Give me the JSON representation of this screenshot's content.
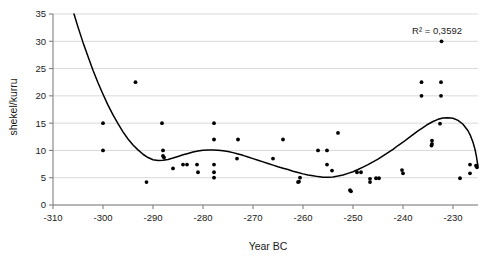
{
  "chart_data": {
    "type": "scatter",
    "title": "",
    "xlabel": "Year BC",
    "ylabel": "shekel/kurru",
    "xlim": [
      -310,
      -225
    ],
    "ylim": [
      0,
      35
    ],
    "xticks": [
      -310,
      -300,
      -290,
      -280,
      -270,
      -260,
      -250,
      -240,
      -230
    ],
    "xtick_labels": [
      "-310",
      "-300",
      "-290",
      "-280",
      "-270",
      "-260",
      "-250",
      "-240",
      "-230"
    ],
    "yticks": [
      0,
      5,
      10,
      15,
      20,
      25,
      30,
      35
    ],
    "ytick_labels": [
      "0",
      "5",
      "10",
      "15",
      "20",
      "25",
      "30",
      "35"
    ],
    "grid": "horizontal",
    "legend": "none",
    "annotations": [
      {
        "name": "r-squared",
        "text": "R² = 0,3592",
        "x": -232,
        "y": 32.5
      }
    ],
    "points": [
      {
        "x": -300.0,
        "y": 15.0
      },
      {
        "x": -300.0,
        "y": 10.0
      },
      {
        "x": -293.5,
        "y": 22.5
      },
      {
        "x": -291.3,
        "y": 4.2
      },
      {
        "x": -288.2,
        "y": 15.0
      },
      {
        "x": -288.0,
        "y": 10.0
      },
      {
        "x": -288.0,
        "y": 9.0
      },
      {
        "x": -287.8,
        "y": 8.7
      },
      {
        "x": -286.0,
        "y": 6.7
      },
      {
        "x": -284.0,
        "y": 7.4
      },
      {
        "x": -283.2,
        "y": 7.4
      },
      {
        "x": -281.2,
        "y": 7.4
      },
      {
        "x": -281.0,
        "y": 6.0
      },
      {
        "x": -277.8,
        "y": 15.0
      },
      {
        "x": -277.8,
        "y": 12.0
      },
      {
        "x": -277.8,
        "y": 7.4
      },
      {
        "x": -277.8,
        "y": 6.0
      },
      {
        "x": -277.8,
        "y": 5.0
      },
      {
        "x": -273.0,
        "y": 12.0
      },
      {
        "x": -273.2,
        "y": 8.5
      },
      {
        "x": -266.0,
        "y": 8.5
      },
      {
        "x": -264.0,
        "y": 12.0
      },
      {
        "x": -260.6,
        "y": 5.0
      },
      {
        "x": -260.8,
        "y": 4.3
      },
      {
        "x": -261.0,
        "y": 4.2
      },
      {
        "x": -257.0,
        "y": 10.0
      },
      {
        "x": -255.2,
        "y": 10.0
      },
      {
        "x": -255.2,
        "y": 7.4
      },
      {
        "x": -254.2,
        "y": 6.3
      },
      {
        "x": -253.0,
        "y": 13.2
      },
      {
        "x": -250.6,
        "y": 2.7
      },
      {
        "x": -250.4,
        "y": 2.5
      },
      {
        "x": -249.2,
        "y": 6.0
      },
      {
        "x": -248.4,
        "y": 6.0
      },
      {
        "x": -246.6,
        "y": 4.8
      },
      {
        "x": -246.6,
        "y": 4.2
      },
      {
        "x": -245.4,
        "y": 4.9
      },
      {
        "x": -244.8,
        "y": 4.9
      },
      {
        "x": -240.2,
        "y": 6.4
      },
      {
        "x": -240.0,
        "y": 5.8
      },
      {
        "x": -236.3,
        "y": 22.5
      },
      {
        "x": -236.3,
        "y": 20.0
      },
      {
        "x": -234.2,
        "y": 11.8
      },
      {
        "x": -234.2,
        "y": 11.2
      },
      {
        "x": -234.3,
        "y": 10.9
      },
      {
        "x": -232.3,
        "y": 30.0
      },
      {
        "x": -232.4,
        "y": 22.5
      },
      {
        "x": -232.4,
        "y": 20.0
      },
      {
        "x": -232.6,
        "y": 14.9
      },
      {
        "x": -228.6,
        "y": 4.9
      },
      {
        "x": -226.6,
        "y": 7.4
      },
      {
        "x": -226.6,
        "y": 5.8
      },
      {
        "x": -225.4,
        "y": 7.2
      },
      {
        "x": -225.2,
        "y": 6.9
      }
    ],
    "trendline": {
      "name": "polynomial-trendline",
      "r_squared": 0.3592,
      "r_squared_display": "0,3592",
      "points": [
        {
          "x": -305.8,
          "y": 35.0
        },
        {
          "x": -305.0,
          "y": 32.6
        },
        {
          "x": -304.0,
          "y": 29.8
        },
        {
          "x": -303.0,
          "y": 27.2
        },
        {
          "x": -302.0,
          "y": 24.7
        },
        {
          "x": -301.0,
          "y": 22.4
        },
        {
          "x": -300.0,
          "y": 20.3
        },
        {
          "x": -299.0,
          "y": 18.3
        },
        {
          "x": -298.0,
          "y": 16.5
        },
        {
          "x": -297.0,
          "y": 14.9
        },
        {
          "x": -296.0,
          "y": 13.4
        },
        {
          "x": -295.0,
          "y": 12.1
        },
        {
          "x": -294.0,
          "y": 11.0
        },
        {
          "x": -293.0,
          "y": 10.1
        },
        {
          "x": -292.0,
          "y": 9.3
        },
        {
          "x": -291.0,
          "y": 8.7
        },
        {
          "x": -290.0,
          "y": 8.3
        },
        {
          "x": -289.0,
          "y": 8.15
        },
        {
          "x": -288.0,
          "y": 8.2
        },
        {
          "x": -287.0,
          "y": 8.35
        },
        {
          "x": -286.0,
          "y": 8.6
        },
        {
          "x": -285.0,
          "y": 8.9
        },
        {
          "x": -284.0,
          "y": 9.2
        },
        {
          "x": -283.0,
          "y": 9.45
        },
        {
          "x": -282.0,
          "y": 9.7
        },
        {
          "x": -281.0,
          "y": 9.9
        },
        {
          "x": -280.0,
          "y": 10.05
        },
        {
          "x": -279.0,
          "y": 10.1
        },
        {
          "x": -278.0,
          "y": 10.1
        },
        {
          "x": -277.0,
          "y": 10.05
        },
        {
          "x": -276.0,
          "y": 9.95
        },
        {
          "x": -275.0,
          "y": 9.8
        },
        {
          "x": -274.0,
          "y": 9.6
        },
        {
          "x": -273.0,
          "y": 9.35
        },
        {
          "x": -272.0,
          "y": 9.1
        },
        {
          "x": -271.0,
          "y": 8.8
        },
        {
          "x": -270.0,
          "y": 8.5
        },
        {
          "x": -269.0,
          "y": 8.2
        },
        {
          "x": -268.0,
          "y": 7.9
        },
        {
          "x": -267.0,
          "y": 7.6
        },
        {
          "x": -266.0,
          "y": 7.3
        },
        {
          "x": -265.0,
          "y": 7.0
        },
        {
          "x": -264.0,
          "y": 6.75
        },
        {
          "x": -263.0,
          "y": 6.5
        },
        {
          "x": -262.0,
          "y": 6.2
        },
        {
          "x": -261.0,
          "y": 5.95
        },
        {
          "x": -260.0,
          "y": 5.7
        },
        {
          "x": -259.0,
          "y": 5.5
        },
        {
          "x": -258.0,
          "y": 5.35
        },
        {
          "x": -257.0,
          "y": 5.2
        },
        {
          "x": -256.0,
          "y": 5.1
        },
        {
          "x": -255.0,
          "y": 5.1
        },
        {
          "x": -254.0,
          "y": 5.15
        },
        {
          "x": -253.0,
          "y": 5.3
        },
        {
          "x": -252.0,
          "y": 5.5
        },
        {
          "x": -251.0,
          "y": 5.8
        },
        {
          "x": -250.0,
          "y": 6.1
        },
        {
          "x": -249.0,
          "y": 6.5
        },
        {
          "x": -248.0,
          "y": 6.95
        },
        {
          "x": -247.0,
          "y": 7.4
        },
        {
          "x": -246.0,
          "y": 7.9
        },
        {
          "x": -245.0,
          "y": 8.4
        },
        {
          "x": -244.0,
          "y": 9.0
        },
        {
          "x": -243.0,
          "y": 9.6
        },
        {
          "x": -242.0,
          "y": 10.2
        },
        {
          "x": -241.0,
          "y": 10.9
        },
        {
          "x": -240.0,
          "y": 11.5
        },
        {
          "x": -239.0,
          "y": 12.2
        },
        {
          "x": -238.0,
          "y": 12.9
        },
        {
          "x": -237.0,
          "y": 13.6
        },
        {
          "x": -236.0,
          "y": 14.2
        },
        {
          "x": -235.0,
          "y": 14.8
        },
        {
          "x": -234.0,
          "y": 15.3
        },
        {
          "x": -233.0,
          "y": 15.7
        },
        {
          "x": -232.0,
          "y": 15.95
        },
        {
          "x": -231.0,
          "y": 16.0
        },
        {
          "x": -230.0,
          "y": 15.9
        },
        {
          "x": -229.0,
          "y": 15.5
        },
        {
          "x": -228.0,
          "y": 14.8
        },
        {
          "x": -227.0,
          "y": 13.6
        },
        {
          "x": -226.5,
          "y": 12.7
        },
        {
          "x": -226.0,
          "y": 11.5
        },
        {
          "x": -225.6,
          "y": 10.2
        },
        {
          "x": -225.3,
          "y": 8.8
        },
        {
          "x": -225.1,
          "y": 7.6
        },
        {
          "x": -225.0,
          "y": 7.2
        }
      ]
    },
    "style": {
      "point_color": "#000000",
      "line_color": "#000000",
      "grid_color": "#d9d9d9",
      "axis_color": "#808080",
      "background": "#ffffff"
    }
  }
}
